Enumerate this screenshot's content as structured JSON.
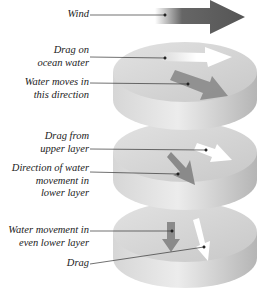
{
  "labels": {
    "wind": [
      "Wind"
    ],
    "drag_on_ocean": [
      "Drag on",
      "ocean water"
    ],
    "water_moves": [
      "Water moves in",
      "this direction"
    ],
    "drag_upper": [
      "Drag from",
      "upper layer"
    ],
    "direction_lower": [
      "Direction of water",
      "movement in",
      "lower layer"
    ],
    "water_even_lower": [
      "Water movement in",
      "even lower layer"
    ],
    "drag": [
      "Drag"
    ]
  },
  "colors": {
    "disk_light": "#e8e8e8",
    "disk_mid": "#cfcfcf",
    "disk_dark": "#b0b0b0",
    "wind_arrow": "#555555",
    "water_arrow": "#8a8a8a",
    "drag_arrow": "#ffffff",
    "leader": "#333333"
  }
}
